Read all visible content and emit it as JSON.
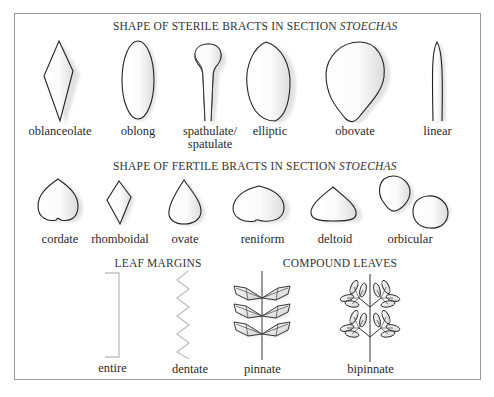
{
  "sections": {
    "sterile": {
      "title_prefix": "SHAPE OF STERILE BRACTS IN SECTION ",
      "title_italic": "STOECHAS",
      "items": [
        {
          "label": "oblanceolate"
        },
        {
          "label": "oblong"
        },
        {
          "label": "spathulate/",
          "label2": "spatulate"
        },
        {
          "label": "elliptic"
        },
        {
          "label": "obovate"
        },
        {
          "label": "linear"
        }
      ]
    },
    "fertile": {
      "title_prefix": "SHAPE OF FERTILE BRACTS IN SECTION ",
      "title_italic": "STOECHAS",
      "items": [
        {
          "label": "cordate"
        },
        {
          "label": "rhomboidal"
        },
        {
          "label": "ovate"
        },
        {
          "label": "reniform"
        },
        {
          "label": "deltoid"
        },
        {
          "label": "orbicular"
        }
      ]
    },
    "leaf_margins": {
      "title": "LEAF MARGINS",
      "items": [
        {
          "label": "entire"
        },
        {
          "label": "dentate"
        }
      ]
    },
    "compound_leaves": {
      "title": "COMPOUND LEAVES",
      "items": [
        {
          "label": "pinnate"
        },
        {
          "label": "bipinnate"
        }
      ]
    }
  }
}
